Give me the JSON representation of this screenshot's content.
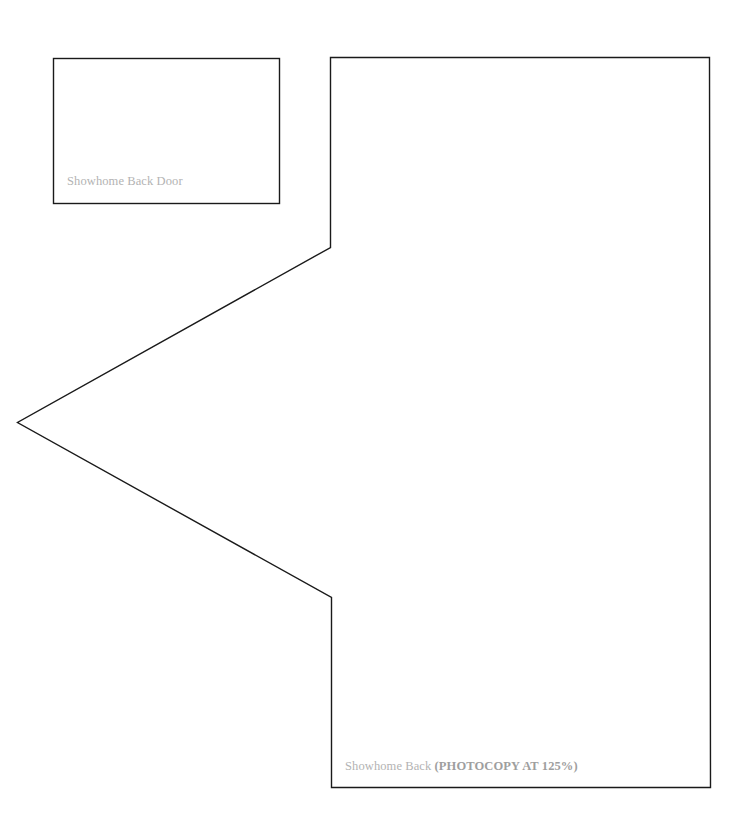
{
  "pieces": [
    {
      "id": "showhome-back-door",
      "shape": "rectangle",
      "label": "Showhome Back Door"
    },
    {
      "id": "showhome-back",
      "shape": "pentagon-with-pointed-left-side",
      "label": "Showhome Back",
      "note": "(PHOTOCOPY AT 125%)"
    }
  ],
  "colors": {
    "outline": "#1a1a1a",
    "label_text": "#b3b3b3",
    "note_text": "#9e9e9e",
    "background": "#ffffff"
  }
}
